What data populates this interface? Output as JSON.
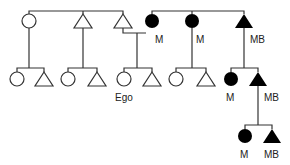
{
  "diagram": {
    "type": "kinship-chart",
    "colors": {
      "line": "#333333",
      "filled": "#000000",
      "open": "#ffffff"
    },
    "labels": {
      "gen1_m_a": "M",
      "gen1_m_b": "M",
      "gen1_mb": "MB",
      "ego": "Ego",
      "gen2_m": "M",
      "gen2_mb": "MB",
      "gen3_m": "M",
      "gen3_mb": "MB"
    },
    "legend": {
      "circle": "female",
      "triangle": "male",
      "filled": "matrilineage member"
    }
  }
}
